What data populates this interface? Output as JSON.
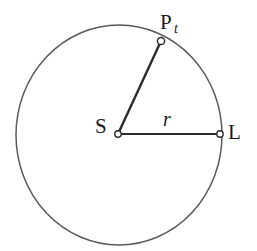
{
  "figure": {
    "type": "geometry-diagram",
    "background_color": "#ffffff",
    "stroke_color_circle": "#5a5a5a",
    "stroke_color_radius": "#2b2b2b",
    "marker_fill": "#ffffff",
    "marker_stroke": "#2b2b2b",
    "text_color": "#1a1a1a"
  },
  "circle": {
    "center_x": 119,
    "center_y": 135,
    "radius_x": 103,
    "radius_y": 110,
    "stroke_width": 1.5
  },
  "points": [
    {
      "id": "center",
      "label": "S",
      "label_part_main": "S",
      "label_part_sub": "",
      "x": 118,
      "y": 134,
      "label_x": 95,
      "label_y": 133,
      "marker_radius": 3.2
    },
    {
      "id": "point-l",
      "label": "L",
      "label_part_main": "L",
      "label_part_sub": "",
      "x": 220,
      "y": 134,
      "label_x": 228,
      "label_y": 139,
      "marker_radius": 3.2
    },
    {
      "id": "point-pt",
      "label": "Pt",
      "label_part_main": "P",
      "label_part_sub": "t",
      "x": 161,
      "y": 41,
      "label_x": 160,
      "label_y": 29,
      "marker_radius": 3.6
    }
  ],
  "segments": [
    {
      "id": "radius-sl",
      "from": "center",
      "to": "point-l",
      "label": "r",
      "label_x": 163,
      "label_y": 126,
      "stroke_width": 2.2
    },
    {
      "id": "radius-spt",
      "from": "center",
      "to": "point-pt",
      "label": "",
      "label_x": 0,
      "label_y": 0,
      "stroke_width": 2.4
    }
  ],
  "labels": {
    "center_label": "S",
    "endpoint_label": "L",
    "moving_point_main": "P",
    "moving_point_sub": "t",
    "radius_label": "r"
  }
}
